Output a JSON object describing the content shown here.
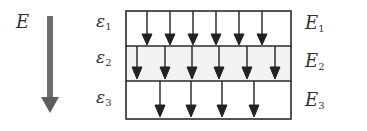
{
  "field_label": "E",
  "diagram": {
    "layers": [
      {
        "epsilon": "ε",
        "epsilon_sub": "1",
        "field": "E",
        "field_sub": "1",
        "arrow_count": 6
      },
      {
        "epsilon": "ε",
        "epsilon_sub": "2",
        "field": "E",
        "field_sub": "2",
        "arrow_count": 6
      },
      {
        "epsilon": "ε",
        "epsilon_sub": "3",
        "field": "E",
        "field_sub": "3",
        "arrow_count": 4
      }
    ]
  },
  "colors": {
    "main_arrow": "#6e6e6e",
    "lines": "#2a2a2a",
    "middle_layer_fill": "#f2f2f2"
  }
}
